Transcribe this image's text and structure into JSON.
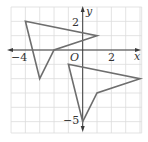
{
  "diagram": {
    "type": "coordinate-plane-rotation",
    "grid": {
      "x_min": -5,
      "x_max": 4,
      "y_min": -5,
      "y_max": 3,
      "unit_px": 14.33,
      "origin_px": [
        82.7,
        50
      ]
    },
    "axes": {
      "x_label": "x",
      "y_label": "y",
      "origin_label": "O",
      "tick_labels": {
        "x": [
          {
            "value": -4,
            "text": "−4"
          },
          {
            "value": 2,
            "text": "2"
          }
        ],
        "y": [
          {
            "value": 2,
            "text": "2"
          },
          {
            "value": -5,
            "text": "−5"
          }
        ]
      }
    },
    "figures": [
      {
        "name": "preimage",
        "vertices": [
          [
            -4,
            2
          ],
          [
            1,
            1
          ],
          [
            -2,
            0
          ],
          [
            -3,
            -2
          ]
        ],
        "color": "#6e6e6e"
      },
      {
        "name": "image",
        "vertices": [
          [
            -1,
            -1
          ],
          [
            4,
            -2
          ],
          [
            1,
            -3
          ],
          [
            0,
            -5
          ]
        ],
        "color": "#6e6e6e"
      }
    ],
    "colors": {
      "grid": "#dcdcdc",
      "axis": "#3a3a3a",
      "shape": "#6e6e6e",
      "label": "#333333"
    }
  }
}
